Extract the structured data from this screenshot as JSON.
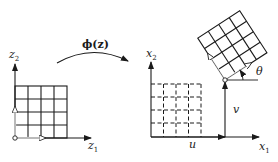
{
  "diagram": {
    "type": "coordinate-transformation",
    "colors": {
      "ink": "#1a1a1a",
      "background": "#ffffff"
    },
    "left_panel": {
      "axis_vertical_label": "z",
      "axis_vertical_subscript": "2",
      "axis_horizontal_label": "z",
      "axis_horizontal_subscript": "1",
      "grid": {
        "rows": 4,
        "cols": 4,
        "style": "solid"
      }
    },
    "mapping": {
      "label": "ϕ(z)"
    },
    "right_panel": {
      "axis_vertical_label": "x",
      "axis_vertical_subscript": "2",
      "axis_horizontal_label": "x",
      "axis_horizontal_subscript": "1",
      "original_grid": {
        "rows": 4,
        "cols": 4,
        "style": "dashed"
      },
      "transformed_grid": {
        "rows": 4,
        "cols": 4,
        "style": "solid",
        "rotation_deg": 33
      },
      "translation_horizontal_label": "u",
      "translation_vertical_label": "v",
      "rotation_label": "θ"
    }
  }
}
